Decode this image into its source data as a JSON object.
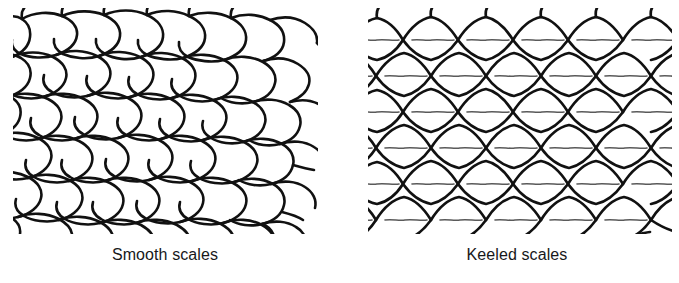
{
  "figure": {
    "background_color": "#ffffff",
    "ink_color": "#111111",
    "keel_color": "#555555"
  },
  "panels": [
    {
      "id": "smooth",
      "caption": "Smooth scales",
      "scale_type": "smooth",
      "description": "Mesh of overlapping rounded oval scales with no central ridge",
      "has_keel": false,
      "rows": 6,
      "columns": 6,
      "bounds": {
        "x": 13,
        "y": 14,
        "width": 305,
        "height": 218
      }
    },
    {
      "id": "keeled",
      "caption": "Keeled scales",
      "scale_type": "keeled",
      "description": "Mesh of overlapping pointed leaf-shaped scales each bearing a horizontal central keel ridge",
      "has_keel": true,
      "rows": 6,
      "columns": 6,
      "bounds": {
        "x": 368,
        "y": 14,
        "width": 304,
        "height": 218
      }
    }
  ]
}
